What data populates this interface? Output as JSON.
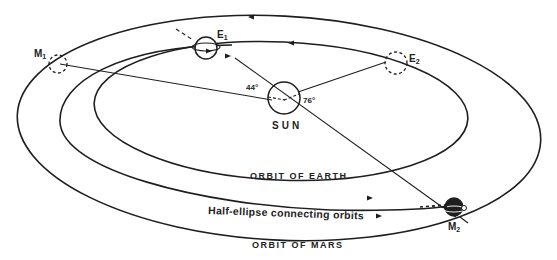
{
  "diagram": {
    "labels": {
      "sun": "SUN",
      "earth_start": "E",
      "earth_start_sub": "1",
      "earth_end": "E",
      "earth_end_sub": "2",
      "mars_start": "M",
      "mars_start_sub": "1",
      "mars_end": "M",
      "mars_end_sub": "2",
      "angle_left": "44°",
      "angle_right": "76°",
      "orbit_earth": "ORBIT OF EARTH",
      "orbit_mars": "ORBIT OF MARS",
      "transfer": "Half-ellipse connecting orbits"
    },
    "colors": {
      "line": "#1e1e1e",
      "background": "#ffffff"
    },
    "nodes": [
      {
        "id": "sun",
        "label": "SUN",
        "shape": "circle"
      },
      {
        "id": "E1",
        "label": "E1",
        "desc": "Earth at launch",
        "shape": "planet-with-ring"
      },
      {
        "id": "E2",
        "label": "E2",
        "desc": "Earth at arrival",
        "shape": "dashed-circle"
      },
      {
        "id": "M1",
        "label": "M1",
        "desc": "Mars at launch",
        "shape": "dashed-circle"
      },
      {
        "id": "M2",
        "label": "M2",
        "desc": "Mars at arrival",
        "shape": "planet-with-ring"
      }
    ],
    "edges": [
      {
        "from": "E1",
        "to": "M2",
        "label": "Half-ellipse connecting orbits",
        "style": "solid-curve"
      },
      {
        "from": "sun",
        "to": "M1",
        "style": "line"
      },
      {
        "from": "sun",
        "to": "E2",
        "style": "line"
      },
      {
        "from": "E1",
        "to": "M2",
        "via": "sun",
        "style": "line"
      }
    ]
  }
}
